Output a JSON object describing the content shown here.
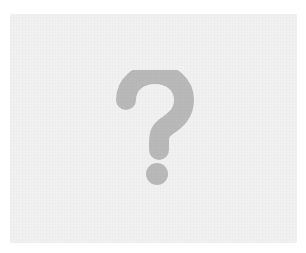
{
  "placeholder": {
    "icon": "question-mark-icon",
    "label": "?",
    "colors": {
      "page_background": "#ffffff",
      "card_background": "#f1f1f1",
      "icon_color": "#b9b9b9"
    }
  }
}
